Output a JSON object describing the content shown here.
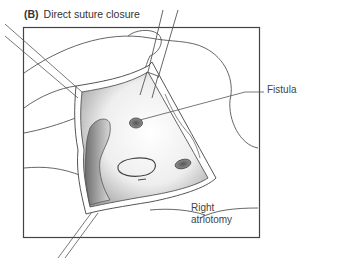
{
  "figure": {
    "panel_letter": "(B)",
    "title": "Direct suture closure"
  },
  "labels": {
    "fistula": "Fistula",
    "atriotomy_line1": "Right",
    "atriotomy_line2": "atriotomy"
  },
  "colors": {
    "stroke": "#555555",
    "frame": "#444444",
    "shade_dark": "#7a7a7a",
    "shade_light": "#f4f4f4",
    "background": "#ffffff"
  }
}
